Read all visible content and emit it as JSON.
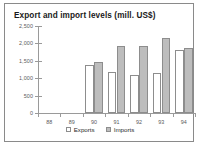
{
  "chart_data": {
    "type": "bar",
    "title": "Export and import levels (mill. US$)",
    "xlabel": "",
    "ylabel": "",
    "categories": [
      "88",
      "89",
      "90",
      "91",
      "92",
      "93",
      "94"
    ],
    "series": [
      {
        "name": "Exports",
        "values": [
          0,
          0,
          1380,
          1190,
          1100,
          1160,
          1810
        ],
        "color": "#ffffff"
      },
      {
        "name": "Imports",
        "values": [
          0,
          0,
          1480,
          1930,
          1930,
          2150,
          1870
        ],
        "color": "#bdbdbd"
      }
    ],
    "ylim": [
      0,
      2500
    ],
    "yticks": [
      0,
      500,
      1000,
      1500,
      2000,
      2500
    ],
    "ytick_labels": [
      "0",
      "500",
      "1,000",
      "1,500",
      "2,000",
      "2,500"
    ],
    "grid": false,
    "legend_position": "bottom"
  },
  "legend": {
    "items": [
      {
        "label": "Exports",
        "swatch": "exports-swatch"
      },
      {
        "label": "Imports",
        "swatch": "imports-swatch"
      }
    ]
  }
}
